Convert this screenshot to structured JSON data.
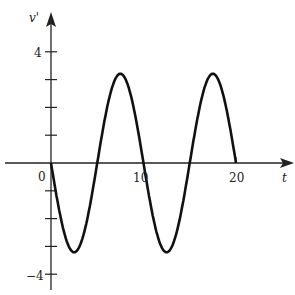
{
  "chart_data": {
    "type": "line",
    "title": "",
    "xlabel": "t",
    "ylabel": "v'",
    "xlim": [
      0,
      22
    ],
    "ylim": [
      -4.5,
      4.5
    ],
    "x_ticks": [
      0,
      10,
      20
    ],
    "x_tick_labels": [
      "0",
      "10",
      "20"
    ],
    "y_ticks": [
      -4,
      -3,
      -2,
      -1,
      1,
      2,
      3,
      4
    ],
    "y_tick_labels": {
      "4": "4",
      "-4": "−4"
    },
    "grid": false,
    "series": [
      {
        "name": "v'(t)",
        "formula": "-3*sin(pi*t/5)",
        "x": [
          0,
          2.5,
          5,
          7.5,
          10,
          12.5,
          15,
          17.5,
          20
        ],
        "values": [
          0,
          -3,
          0,
          3,
          0,
          -3,
          0,
          3,
          0
        ]
      }
    ]
  },
  "labels": {
    "ylabel": "v'",
    "xlabel": "t",
    "origin": "0",
    "x10": "10",
    "x20": "20",
    "y4": "4",
    "yneg4": "−4"
  }
}
